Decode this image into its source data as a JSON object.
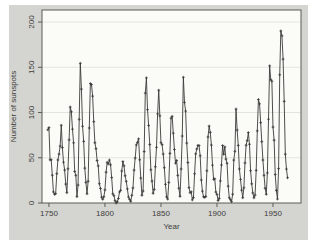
{
  "figure": {
    "background": "#ffffff"
  },
  "chart_data": {
    "type": "line",
    "title": "",
    "xlabel": "Year",
    "ylabel": "Number of sunspots",
    "legend": "none",
    "grid": "horizontal",
    "marker": "plus",
    "x_start_year": 1749,
    "x_step": 1,
    "xticks": [
      1750,
      1800,
      1850,
      1900,
      1950
    ],
    "yticks": [
      0,
      50,
      100,
      150,
      200
    ],
    "xlim": [
      1743.8,
      1975.0
    ],
    "ylim": [
      0,
      213.3
    ],
    "values": [
      80.9,
      83.4,
      47.7,
      47.8,
      30.7,
      12.2,
      9.6,
      10.2,
      32.4,
      47.6,
      54.0,
      62.9,
      85.9,
      61.2,
      45.1,
      36.4,
      20.9,
      11.4,
      37.8,
      69.8,
      106.1,
      100.8,
      81.6,
      66.5,
      34.8,
      30.6,
      7.0,
      19.8,
      92.5,
      154.4,
      125.9,
      84.8,
      68.1,
      38.5,
      22.8,
      10.2,
      24.1,
      82.9,
      132.0,
      130.9,
      118.1,
      89.9,
      66.6,
      60.0,
      46.9,
      41.0,
      21.3,
      16.0,
      6.4,
      4.1,
      6.8,
      14.5,
      34.0,
      45.0,
      43.1,
      47.5,
      42.2,
      28.1,
      10.1,
      8.1,
      2.5,
      0.0,
      1.4,
      5.0,
      12.2,
      13.9,
      35.4,
      45.8,
      41.1,
      30.1,
      23.9,
      15.6,
      6.6,
      4.0,
      1.8,
      8.5,
      16.6,
      36.3,
      49.6,
      64.2,
      67.0,
      70.9,
      47.8,
      27.5,
      8.5,
      13.2,
      56.9,
      121.5,
      138.3,
      103.2,
      85.7,
      64.6,
      36.7,
      24.2,
      10.7,
      15.0,
      40.1,
      61.5,
      98.5,
      124.7,
      96.3,
      66.6,
      64.5,
      54.1,
      39.0,
      20.6,
      6.7,
      4.3,
      22.7,
      54.8,
      93.8,
      95.8,
      77.2,
      59.1,
      44.0,
      47.0,
      30.5,
      16.3,
      7.3,
      37.6,
      74.0,
      139.0,
      111.2,
      101.6,
      66.2,
      44.7,
      17.0,
      11.3,
      12.4,
      3.4,
      6.0,
      32.3,
      54.3,
      59.7,
      63.7,
      63.5,
      52.2,
      25.4,
      13.1,
      6.8,
      6.3,
      7.1,
      35.6,
      73.0,
      85.1,
      78.0,
      64.0,
      41.8,
      26.2,
      26.7,
      12.1,
      9.5,
      2.7,
      5.0,
      24.4,
      42.0,
      63.5,
      53.8,
      62.0,
      48.5,
      43.9,
      18.6,
      5.7,
      3.6,
      1.4,
      9.6,
      47.4,
      57.1,
      103.9,
      80.6,
      63.6,
      37.6,
      26.1,
      14.2,
      5.8,
      16.7,
      44.3,
      63.9,
      69.0,
      77.8,
      64.9,
      35.7,
      21.2,
      11.1,
      5.7,
      8.7,
      36.1,
      79.7,
      114.4,
      109.6,
      88.8,
      67.8,
      47.5,
      30.6,
      16.3,
      9.6,
      33.2,
      92.6,
      151.6,
      136.3,
      134.7,
      83.9,
      69.4,
      31.5,
      13.9,
      4.4,
      38.0,
      141.7,
      190.2,
      184.8,
      159.0,
      112.3,
      53.9,
      37.5,
      27.9
    ],
    "colors": {
      "panel_bg": "#d4d4d0",
      "plot_bg": "#fbfbf8",
      "grid": "#e4e4df",
      "frame": "#5c5c57",
      "line": "#3a3a38",
      "text": "#3d3d3b"
    }
  }
}
